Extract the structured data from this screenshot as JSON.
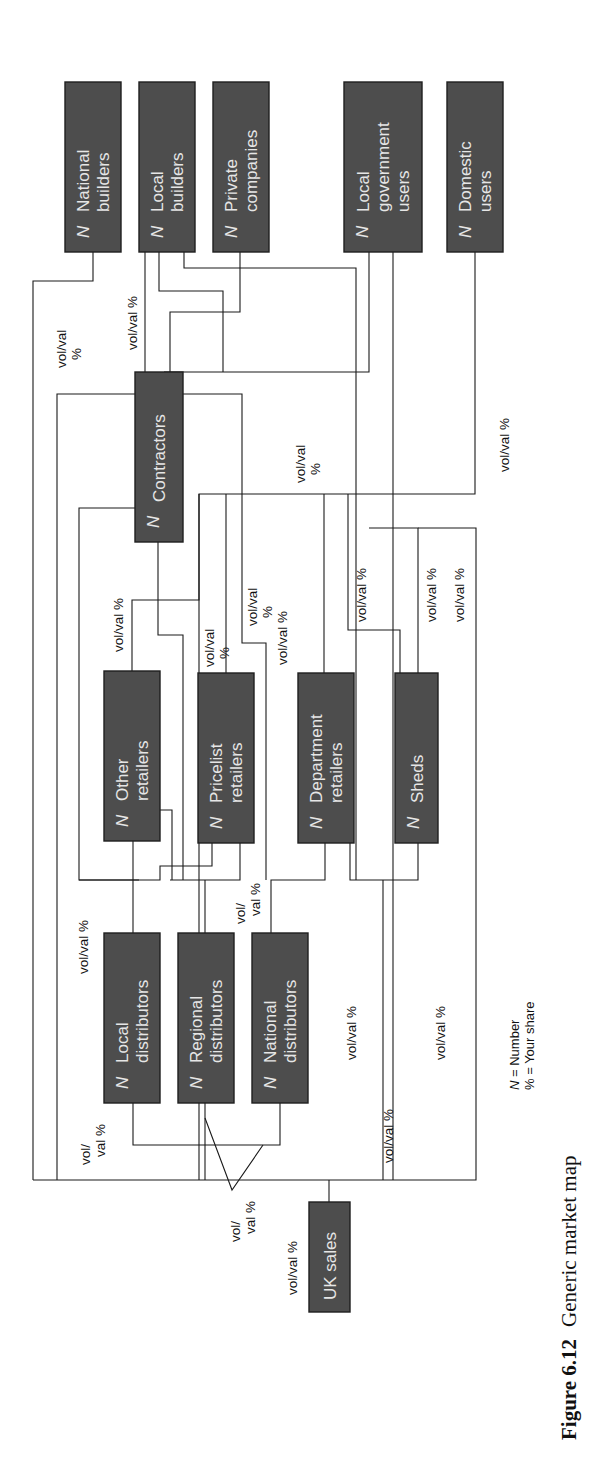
{
  "figure": {
    "caption_number": "Figure 6.12",
    "caption_title": "Generic market map",
    "legend": {
      "n_symbol": "N",
      "n_meaning": " = Number",
      "pct_line": "% = Your share"
    }
  },
  "colors": {
    "box_fill": "#4d4d4d",
    "box_text": "#e6e6e6",
    "line": "#1a1a1a",
    "background": "#ffffff"
  },
  "nodes": [
    {
      "id": "national-builders",
      "lines": [
        "National",
        "builders"
      ],
      "n": "N",
      "x": 65,
      "y": 82,
      "w": 56,
      "h": 170
    },
    {
      "id": "local-builders",
      "lines": [
        "Local",
        "builders"
      ],
      "n": "N",
      "x": 139,
      "y": 82,
      "w": 56,
      "h": 170
    },
    {
      "id": "private-companies",
      "lines": [
        "Private",
        "companies"
      ],
      "n": "N",
      "x": 213,
      "y": 82,
      "w": 56,
      "h": 170
    },
    {
      "id": "local-government-users",
      "lines": [
        "Local",
        "government",
        "users"
      ],
      "n": "N",
      "x": 344,
      "y": 82,
      "w": 78,
      "h": 170
    },
    {
      "id": "domestic-users",
      "lines": [
        "Domestic",
        "users"
      ],
      "n": "N",
      "x": 447,
      "y": 82,
      "w": 56,
      "h": 170
    },
    {
      "id": "contractors",
      "lines": [
        "Contractors"
      ],
      "n": "N",
      "x": 135,
      "y": 372,
      "w": 48,
      "h": 170
    },
    {
      "id": "other-retailers",
      "lines": [
        "Other",
        "retailers"
      ],
      "n": "N",
      "x": 104,
      "y": 671,
      "w": 56,
      "h": 170
    },
    {
      "id": "pricelist-retailers",
      "lines": [
        "Pricelist",
        "retailers"
      ],
      "n": "N",
      "x": 198,
      "y": 673,
      "w": 56,
      "h": 170
    },
    {
      "id": "department-retailers",
      "lines": [
        "Department",
        "retailers"
      ],
      "n": "N",
      "x": 298,
      "y": 673,
      "w": 56,
      "h": 170
    },
    {
      "id": "sheds",
      "lines": [
        "Sheds"
      ],
      "n": "N",
      "x": 395,
      "y": 673,
      "w": 43,
      "h": 170
    },
    {
      "id": "local-distributors",
      "lines": [
        "Local",
        "distributors"
      ],
      "n": "N",
      "x": 104,
      "y": 933,
      "w": 56,
      "h": 170
    },
    {
      "id": "regional-distributors",
      "lines": [
        "Regional",
        "distributors"
      ],
      "n": "N",
      "x": 178,
      "y": 933,
      "w": 56,
      "h": 170
    },
    {
      "id": "national-distributors",
      "lines": [
        "National",
        "distributors"
      ],
      "n": "N",
      "x": 252,
      "y": 933,
      "w": 56,
      "h": 170
    },
    {
      "id": "uk-sales",
      "lines": [
        "UK sales"
      ],
      "n": "",
      "x": 309,
      "y": 1202,
      "w": 41,
      "h": 110
    }
  ],
  "flow_labels": [
    {
      "id": "national-builders-share",
      "lines": [
        "vol/val",
        "%"
      ],
      "x": 66,
      "y": 368
    },
    {
      "id": "local-builders-share",
      "lines": [
        "vol/val %"
      ],
      "x": 137,
      "y": 350
    },
    {
      "id": "local-gov-share",
      "lines": [
        "vol/val",
        "%"
      ],
      "x": 305,
      "y": 483
    },
    {
      "id": "domestic-share",
      "lines": [
        "vol/val %"
      ],
      "x": 509,
      "y": 472
    },
    {
      "id": "other-retailers-share",
      "lines": [
        "vol/val %"
      ],
      "x": 123,
      "y": 652
    },
    {
      "id": "pricelist-share",
      "lines": [
        "vol/val",
        "%"
      ],
      "x": 214,
      "y": 667
    },
    {
      "id": "contractor-mid-share",
      "lines": [
        "vol/val",
        "%"
      ],
      "x": 257,
      "y": 626
    },
    {
      "id": "department-share",
      "lines": [
        "vol/val %"
      ],
      "x": 287,
      "y": 665
    },
    {
      "id": "sheds-share-a",
      "lines": [
        "vol/val %"
      ],
      "x": 366,
      "y": 622
    },
    {
      "id": "sheds-share-b",
      "lines": [
        "vol/val %"
      ],
      "x": 436,
      "y": 622
    },
    {
      "id": "sheds-share-c",
      "lines": [
        "vol/val %"
      ],
      "x": 464,
      "y": 622
    },
    {
      "id": "local-distributors-share",
      "lines": [
        "vol/val %"
      ],
      "x": 88,
      "y": 974
    },
    {
      "id": "national-distributors-share",
      "lines": [
        "vol/",
        "val %"
      ],
      "x": 245,
      "y": 924
    },
    {
      "id": "department-bottom-share",
      "lines": [
        "vol/val %"
      ],
      "x": 356,
      "y": 1060
    },
    {
      "id": "sheds-bottom-share",
      "lines": [
        "vol/val %"
      ],
      "x": 445,
      "y": 1060
    },
    {
      "id": "direct-share",
      "lines": [
        "vol/val %"
      ],
      "x": 393,
      "y": 1163
    },
    {
      "id": "local-left-share",
      "lines": [
        "vol/",
        "val %"
      ],
      "x": 90,
      "y": 1165
    },
    {
      "id": "distributors-triangle-share",
      "lines": [
        "vol/",
        "val %"
      ],
      "x": 240,
      "y": 1242
    },
    {
      "id": "uk-sales-share",
      "lines": [
        "vol/val %"
      ],
      "x": 297,
      "y": 1295
    }
  ],
  "connectors": [
    [
      [
        93,
        252
      ],
      [
        93,
        281
      ],
      [
        33,
        281
      ],
      [
        33,
        1180
      ]
    ],
    [
      [
        145,
        252
      ],
      [
        145,
        372
      ]
    ],
    [
      [
        184,
        252
      ],
      [
        184,
        268
      ],
      [
        356,
        268
      ],
      [
        356,
        880
      ]
    ],
    [
      [
        159,
        252
      ],
      [
        159,
        291
      ],
      [
        223,
        291
      ],
      [
        223,
        372
      ]
    ],
    [
      [
        240,
        252
      ],
      [
        240,
        312
      ],
      [
        170,
        312
      ],
      [
        170,
        372
      ]
    ],
    [
      [
        369,
        252
      ],
      [
        369,
        372
      ],
      [
        164,
        372
      ]
    ],
    [
      [
        393,
        252
      ],
      [
        393,
        1180
      ]
    ],
    [
      [
        475,
        252
      ],
      [
        475,
        494
      ],
      [
        199,
        494
      ],
      [
        199,
        1180
      ]
    ],
    [
      [
        135,
        394
      ],
      [
        57,
        394
      ],
      [
        57,
        1180
      ]
    ],
    [
      [
        183,
        394
      ],
      [
        242,
        394
      ],
      [
        242,
        494
      ]
    ],
    [
      [
        135,
        508
      ],
      [
        79,
        508
      ],
      [
        79,
        880
      ],
      [
        139,
        880
      ]
    ],
    [
      [
        158,
        542
      ],
      [
        158,
        635
      ],
      [
        183,
        635
      ],
      [
        183,
        880
      ]
    ],
    [
      [
        132,
        671
      ],
      [
        132,
        600
      ],
      [
        199,
        600
      ],
      [
        199,
        494
      ]
    ],
    [
      [
        226,
        673
      ],
      [
        226,
        494
      ]
    ],
    [
      [
        242,
        494
      ],
      [
        242,
        643
      ],
      [
        266,
        643
      ],
      [
        266,
        880
      ]
    ],
    [
      [
        324,
        673
      ],
      [
        324,
        494
      ]
    ],
    [
      [
        348,
        494
      ],
      [
        348,
        630
      ],
      [
        400,
        630
      ],
      [
        400,
        673
      ]
    ],
    [
      [
        418,
        673
      ],
      [
        418,
        528
      ],
      [
        369,
        528
      ]
    ],
    [
      [
        133,
        841
      ],
      [
        133,
        933
      ]
    ],
    [
      [
        160,
        810
      ],
      [
        172,
        810
      ],
      [
        172,
        880
      ]
    ],
    [
      [
        212,
        843
      ],
      [
        212,
        866
      ],
      [
        160,
        866
      ],
      [
        160,
        880
      ],
      [
        79,
        880
      ]
    ],
    [
      [
        240,
        843
      ],
      [
        240,
        880
      ],
      [
        170,
        880
      ]
    ],
    [
      [
        205,
        880
      ],
      [
        205,
        933
      ]
    ],
    [
      [
        325,
        843
      ],
      [
        325,
        880
      ],
      [
        271,
        880
      ],
      [
        271,
        933
      ]
    ],
    [
      [
        350,
        843
      ],
      [
        350,
        880
      ],
      [
        418,
        880
      ],
      [
        418,
        843
      ]
    ],
    [
      [
        383,
        880
      ],
      [
        383,
        1180
      ]
    ],
    [
      [
        133,
        1103
      ],
      [
        133,
        1145
      ],
      [
        280,
        1145
      ],
      [
        280,
        1103
      ]
    ],
    [
      [
        205,
        1103
      ],
      [
        205,
        1180
      ]
    ],
    [
      [
        205,
        1118
      ],
      [
        232,
        1190
      ],
      [
        263,
        1145
      ]
    ],
    [
      [
        33,
        1180
      ],
      [
        476,
        1180
      ],
      [
        476,
        528
      ],
      [
        418,
        528
      ]
    ],
    [
      [
        329,
        1180
      ],
      [
        329,
        1202
      ]
    ]
  ]
}
